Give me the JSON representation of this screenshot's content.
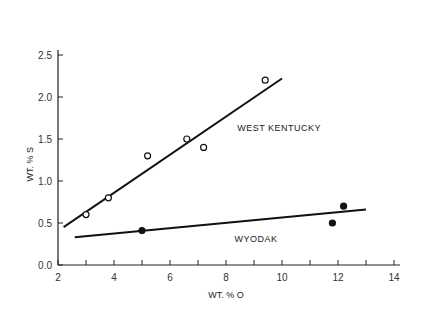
{
  "chart_data": {
    "type": "scatter",
    "title": "",
    "xlabel": "WT. % O",
    "ylabel": "WT. % S",
    "xlim": [
      2,
      14
    ],
    "ylim": [
      0.0,
      2.5
    ],
    "xticks": [
      2,
      4,
      6,
      8,
      10,
      12,
      14
    ],
    "xtick_labels": [
      "2",
      "4",
      "6",
      "8",
      "10",
      "12",
      "14"
    ],
    "yticks": [
      0.0,
      0.5,
      1.0,
      1.5,
      2.0,
      2.5
    ],
    "ytick_labels": [
      "0.0",
      "0.5",
      "1.0",
      "1.5",
      "2.0",
      "2.5"
    ],
    "grid": false,
    "series": [
      {
        "name": "WEST KENTUCKY",
        "marker": "open-circle",
        "x": [
          3.0,
          3.8,
          5.2,
          6.6,
          7.2,
          9.4
        ],
        "y": [
          0.6,
          0.8,
          1.3,
          1.5,
          1.4,
          2.2
        ],
        "fit_line": {
          "x": [
            2.2,
            10.0
          ],
          "y": [
            0.45,
            2.22
          ]
        }
      },
      {
        "name": "WYODAK",
        "marker": "filled-circle",
        "x": [
          5.0,
          11.8,
          12.2
        ],
        "y": [
          0.41,
          0.5,
          0.7
        ],
        "fit_line": {
          "x": [
            2.6,
            13.0
          ],
          "y": [
            0.33,
            0.66
          ]
        }
      }
    ],
    "annotations": [
      {
        "text": "WEST KENTUCKY",
        "x": 8.4,
        "y": 1.6
      },
      {
        "text": "WYODAK",
        "x": 8.3,
        "y": 0.27
      }
    ]
  }
}
